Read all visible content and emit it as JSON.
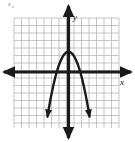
{
  "figure": {
    "width": 135,
    "height": 142,
    "background_color": "#ffffff"
  },
  "grid": {
    "name": "coordinate-grid",
    "left": 14,
    "top": 18,
    "right": 119,
    "bottom": 128,
    "cell_size": 7.5,
    "columns": 14,
    "rows": 15,
    "line_color": "#b8b8b8",
    "line_width": 0.8,
    "visible": true
  },
  "axes": {
    "color": "#1a1a1a",
    "line_width": 3.2,
    "origin_x": 68.5,
    "origin_y": 72,
    "x_axis": {
      "name": "x-axis",
      "label": "x",
      "label_x": 122,
      "label_y": 85,
      "start_x": 4,
      "end_x": 131,
      "arrows": "both"
    },
    "y_axis": {
      "name": "y-axis",
      "label": "y",
      "label_x": 75,
      "label_y": 20,
      "start_y": 6,
      "end_y": 138,
      "arrows": "both"
    }
  },
  "chart_data": {
    "type": "line",
    "xlabel": "x",
    "ylabel": "y",
    "grid": true,
    "legend": false,
    "xlim": [
      -7.3,
      6.7
    ],
    "ylim": [
      -7.5,
      7.2
    ],
    "series": [
      {
        "name": "parabola",
        "curve": "y = -1.1 x^2 + 2.7",
        "vertex": [
          0,
          2.7
        ],
        "opens": "down",
        "roots": [
          -1.1,
          1.1
        ],
        "color": "#1a1a1a",
        "line_width": 2.4,
        "arrow_ends": "both",
        "x": [
          -2.8,
          -2.4,
          -2.0,
          -1.6,
          -1.2,
          -0.8,
          -0.4,
          0.0,
          0.4,
          0.8,
          1.2,
          1.6,
          2.0,
          2.4,
          2.8
        ],
        "y": [
          -5.9,
          -3.6,
          -1.7,
          -0.1,
          1.1,
          2.0,
          2.5,
          2.7,
          2.5,
          2.0,
          1.1,
          -0.1,
          -1.7,
          -3.6,
          -5.9
        ],
        "pixel_points": [
          [
            48,
            116
          ],
          [
            50.5,
            110
          ],
          [
            53,
            103
          ],
          [
            55.5,
            95
          ],
          [
            58,
            85
          ],
          [
            60.5,
            76
          ],
          [
            63,
            65
          ],
          [
            65.5,
            57
          ],
          [
            68.5,
            52
          ],
          [
            71.5,
            57
          ],
          [
            74,
            65
          ],
          [
            76.5,
            76
          ],
          [
            79,
            85
          ],
          [
            81.5,
            95
          ],
          [
            84,
            103
          ],
          [
            86.5,
            110
          ],
          [
            88,
            115
          ]
        ],
        "arrow_tip_left": [
          47,
          119
        ],
        "arrow_tip_right": [
          89,
          118
        ]
      }
    ]
  },
  "artifacts": {
    "name": "scan-speck",
    "items": [
      {
        "x": 8,
        "y": 3,
        "size": 3
      },
      {
        "x": 12,
        "y": 6,
        "size": 2
      }
    ]
  }
}
